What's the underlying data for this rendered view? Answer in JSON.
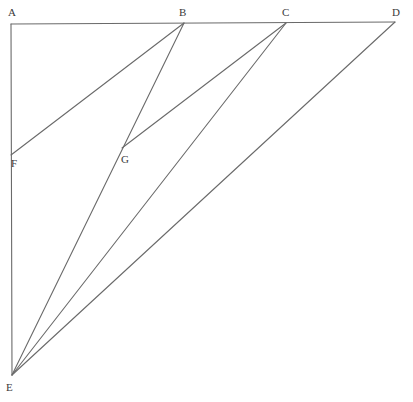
{
  "diagram": {
    "type": "geometric-construction",
    "stroke_color": "#6a6a6a",
    "label_color": "#3a3a3a",
    "points": {
      "A": {
        "x": 11,
        "y": 24
      },
      "B": {
        "x": 184,
        "y": 23
      },
      "C": {
        "x": 286,
        "y": 23
      },
      "D": {
        "x": 395,
        "y": 22
      },
      "E": {
        "x": 12,
        "y": 375
      },
      "F": {
        "x": 11,
        "y": 155
      },
      "G": {
        "x": 122,
        "y": 148
      }
    },
    "labels": [
      {
        "id": "A",
        "text": "A",
        "x": 11,
        "y": 16
      },
      {
        "id": "B",
        "text": "B",
        "x": 182,
        "y": 16
      },
      {
        "id": "C",
        "text": "C",
        "x": 285,
        "y": 16
      },
      {
        "id": "D",
        "text": "D",
        "x": 395,
        "y": 16
      },
      {
        "id": "F",
        "text": "F",
        "x": 14,
        "y": 167
      },
      {
        "id": "G",
        "text": "G",
        "x": 124,
        "y": 163
      },
      {
        "id": "E",
        "text": "E",
        "x": 9,
        "y": 391
      }
    ],
    "segments": [
      {
        "name": "segment-AD",
        "from": "A",
        "to": "D"
      },
      {
        "name": "segment-AE",
        "from": "A",
        "to": "E"
      },
      {
        "name": "segment-FB",
        "from": "F",
        "to": "B"
      },
      {
        "name": "segment-BE",
        "from": "B",
        "to": "E"
      },
      {
        "name": "segment-GC",
        "from": "G",
        "to": "C"
      },
      {
        "name": "segment-CE",
        "from": "C",
        "to": "E"
      },
      {
        "name": "segment-DE",
        "from": "D",
        "to": "E"
      }
    ]
  }
}
